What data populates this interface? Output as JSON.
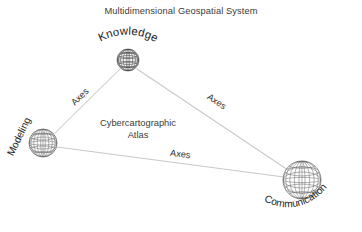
{
  "title": "Multidimensional Geospatial System",
  "center_label": {
    "line1": "Cybercartographic",
    "line2": "Atlas"
  },
  "nodes": [
    {
      "id": "knowledge",
      "label": "Knowledge",
      "cx": 128,
      "cy": 60,
      "r": 11
    },
    {
      "id": "modeling",
      "label": "Modeling",
      "cx": 43,
      "cy": 143,
      "r": 14
    },
    {
      "id": "communication",
      "label": "Communication",
      "cx": 302,
      "cy": 180,
      "r": 19
    }
  ],
  "edges": [
    {
      "id": "knowledge-modeling",
      "label": "Axes"
    },
    {
      "id": "knowledge-communication",
      "label": "Axes"
    },
    {
      "id": "modeling-communication",
      "label": "Axes"
    }
  ],
  "colors": {
    "background": "#ffffff",
    "connector": "#c9c9c9",
    "title_text": "#3b3b3b",
    "label_text": "#1d1d1d",
    "globe_stroke": "#555555"
  },
  "icons": {
    "node": "globe-icon"
  }
}
